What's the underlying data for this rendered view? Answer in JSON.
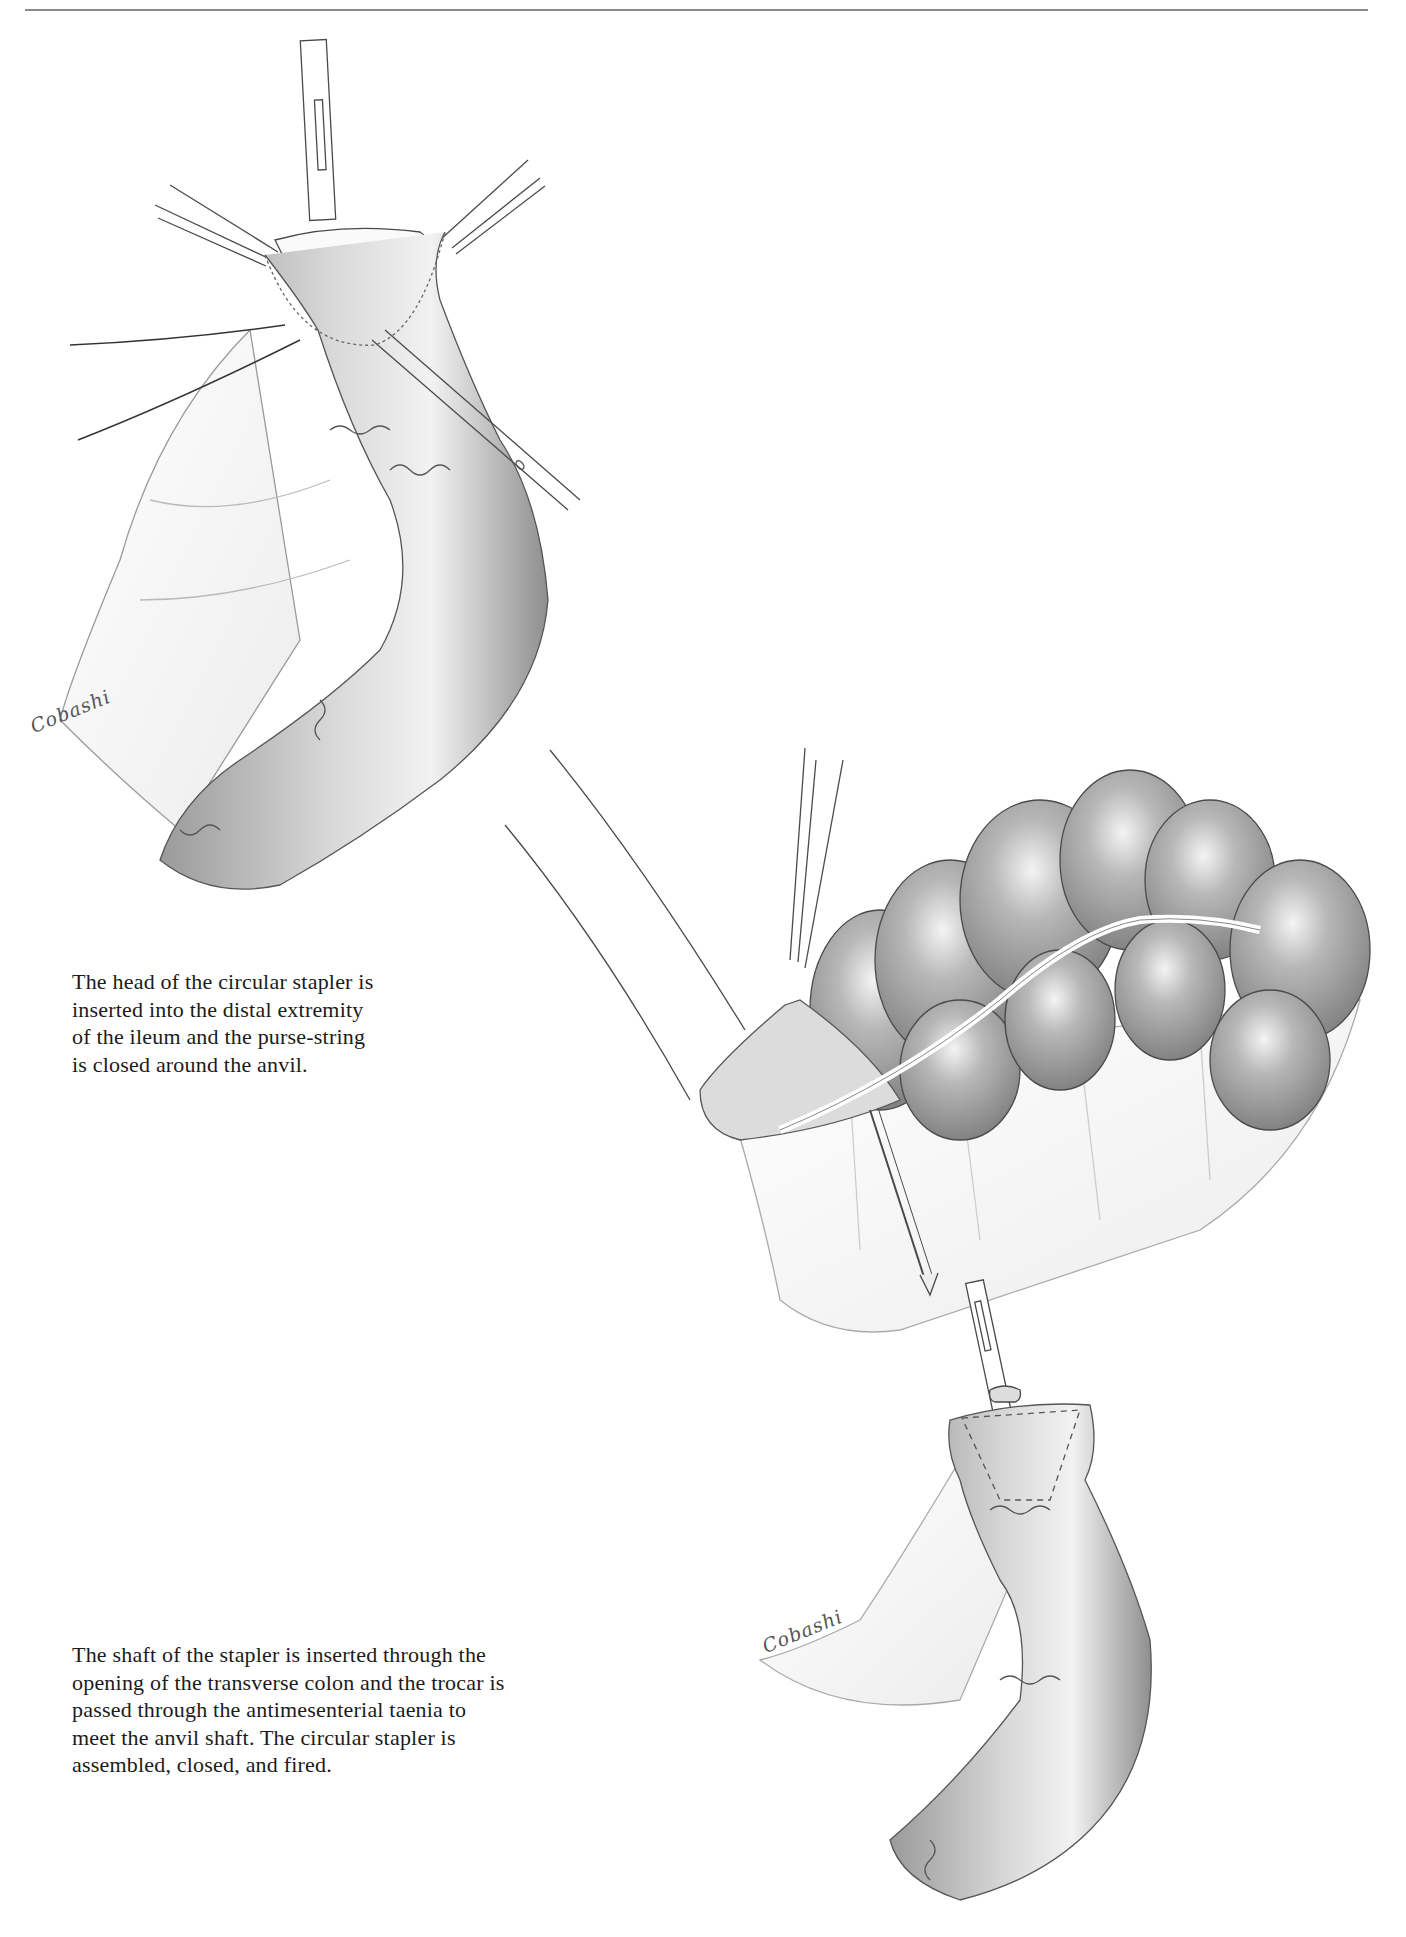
{
  "page": {
    "type": "surgical atlas page",
    "header_rule": true
  },
  "figures": [
    {
      "id": "figure-ileum-anvil",
      "description": "Circular stapler anvil head inserted into the distal ileum with purse-string suture; two clamps hold the bowel edge, a needle holder at right",
      "signature": "Cobashi"
    },
    {
      "id": "figure-transverse-colon",
      "description": "Stapler shaft inserted through the opening of the transverse colon; trocar passing through the antimesenteric taenia"
    },
    {
      "id": "figure-anastomosis",
      "description": "Ileum with anvil shaft meeting the trocar; circular stapler assembled",
      "signature": "Cobashi"
    }
  ],
  "captions": [
    {
      "lines": [
        "The head of the circular stapler is",
        "inserted into the distal extremity",
        "of the ileum and the purse-string",
        "is closed around the anvil."
      ]
    },
    {
      "lines": [
        "The shaft of the stapler is inserted through the",
        "opening of the transverse colon and the trocar is",
        "passed through the antimesenterial taenia to",
        "meet the anvil shaft. The circular stapler is",
        "assembled, closed, and fired."
      ]
    }
  ],
  "colors": {
    "ink": "#1b1b1b",
    "line_art": "#444444",
    "shading_dark": "#8c8c8c",
    "shading_light": "#e6e6e6",
    "rule": "#8a8a8a"
  }
}
